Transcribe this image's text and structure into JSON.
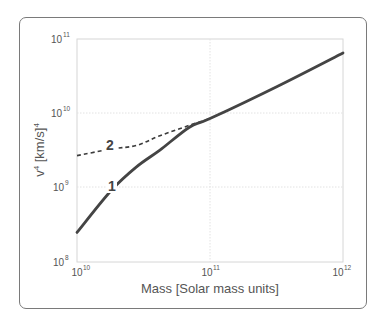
{
  "chart_data": {
    "type": "line",
    "title": "",
    "xlabel": "Mass [Solar mass units]",
    "ylabel": "v^4 [km/s]^4",
    "xscale": "log",
    "yscale": "log",
    "xlim": [
      10000000000.0,
      1000000000000.0
    ],
    "ylim": [
      100000000.0,
      100000000000.0
    ],
    "grid": true,
    "legend": "none (curves labelled inline '1' and '2')",
    "x_ticks": [
      {
        "base": "10",
        "exp": "10"
      },
      {
        "base": "10",
        "exp": "11"
      },
      {
        "base": "10",
        "exp": "12"
      }
    ],
    "y_ticks": [
      {
        "base": "10",
        "exp": "8"
      },
      {
        "base": "10",
        "exp": "9"
      },
      {
        "base": "10",
        "exp": "10"
      },
      {
        "base": "10",
        "exp": "11"
      }
    ],
    "series": [
      {
        "name": "1",
        "style": "solid",
        "color": "#444444",
        "x": [
          10000000000.0,
          18000000000.0,
          28000000000.0,
          42000000000.0,
          70000000000.0,
          100000000000.0,
          320000000000.0,
          1000000000000.0
        ],
        "y": [
          250000000.0,
          910000000.0,
          1900000000.0,
          3200000000.0,
          6500000000.0,
          8500000000.0,
          23000000000.0,
          65000000000.0
        ]
      },
      {
        "name": "2",
        "style": "dashed",
        "color": "#444444",
        "x": [
          10000000000.0,
          18000000000.0,
          28000000000.0,
          42000000000.0,
          70000000000.0,
          100000000000.0,
          320000000000.0,
          1000000000000.0
        ],
        "y": [
          2700000000.0,
          3300000000.0,
          3700000000.0,
          5000000000.0,
          6900000000.0,
          8500000000.0,
          23000000000.0,
          65000000000.0
        ]
      }
    ],
    "annotations": [
      {
        "text": "1",
        "x": 18000000000.0,
        "y": 910000000.0
      },
      {
        "text": "2",
        "x": 18000000000.0,
        "y": 3300000000.0
      }
    ]
  },
  "labels": {
    "xlabel": "Mass [Solar mass units]",
    "ylabel_base": "v",
    "ylabel_sup": "4",
    "ylabel_unit": " [km/s]",
    "ylabel_unit_sup": "4",
    "curve1": "1",
    "curve2": "2",
    "tick_base": "10",
    "xt0": "10",
    "xt1": "11",
    "xt2": "12",
    "yt0": "8",
    "yt1": "9",
    "yt2": "10",
    "yt3": "11"
  }
}
